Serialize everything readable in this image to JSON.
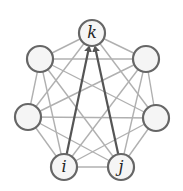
{
  "diagram": {
    "type": "complete-graph",
    "node_count": 7,
    "colors": {
      "background": "#ffffff",
      "edge": "#b0b0b0",
      "arrow": "#555555",
      "node_stroke": "#666666",
      "node_fill": "#f5f5f5",
      "label": "#222222"
    },
    "nodes": [
      {
        "id": "k",
        "label": "k",
        "x": 92,
        "y": 33
      },
      {
        "id": "ur",
        "label": "",
        "x": 146,
        "y": 59
      },
      {
        "id": "r",
        "label": "",
        "x": 156,
        "y": 118
      },
      {
        "id": "j",
        "label": "j",
        "x": 121,
        "y": 167
      },
      {
        "id": "i",
        "label": "i",
        "x": 64,
        "y": 167
      },
      {
        "id": "l",
        "label": "",
        "x": 28,
        "y": 117
      },
      {
        "id": "ul",
        "label": "",
        "x": 40,
        "y": 59
      }
    ],
    "arrows": [
      {
        "from": "i",
        "to": "k"
      },
      {
        "from": "j",
        "to": "k"
      }
    ]
  }
}
